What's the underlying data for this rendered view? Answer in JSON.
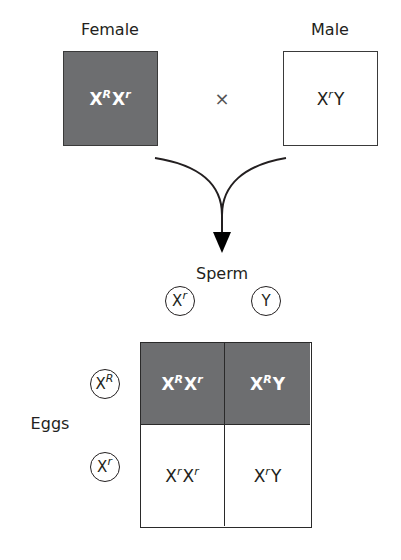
{
  "parents": {
    "female": {
      "label": "Female",
      "genotype": {
        "base1": "X",
        "sup1": "R",
        "base2": "X",
        "sup2": "r"
      },
      "fill": "#6d6e70"
    },
    "male": {
      "label": "Male",
      "genotype": {
        "base1": "X",
        "sup1": "r",
        "base2": "Y",
        "sup2": ""
      },
      "fill": "#ffffff"
    },
    "cross_symbol": "×"
  },
  "gametes": {
    "sperm_label": "Sperm",
    "sperm": [
      {
        "base": "X",
        "sup": "r"
      },
      {
        "base": "Y",
        "sup": ""
      }
    ],
    "eggs_label": "Eggs",
    "eggs": [
      {
        "base": "X",
        "sup": "R"
      },
      {
        "base": "X",
        "sup": "r"
      }
    ]
  },
  "punnett": {
    "cells": [
      {
        "row": 0,
        "col": 0,
        "base1": "X",
        "sup1": "R",
        "base2": "X",
        "sup2": "r",
        "shaded": true
      },
      {
        "row": 0,
        "col": 1,
        "base1": "X",
        "sup1": "R",
        "base2": "Y",
        "sup2": "",
        "shaded": true
      },
      {
        "row": 1,
        "col": 0,
        "base1": "X",
        "sup1": "r",
        "base2": "X",
        "sup2": "r",
        "shaded": false
      },
      {
        "row": 1,
        "col": 1,
        "base1": "X",
        "sup1": "r",
        "base2": "Y",
        "sup2": "",
        "shaded": false
      }
    ]
  },
  "colors": {
    "shaded": "#6d6e70",
    "line": "#231f20",
    "background": "#ffffff"
  }
}
